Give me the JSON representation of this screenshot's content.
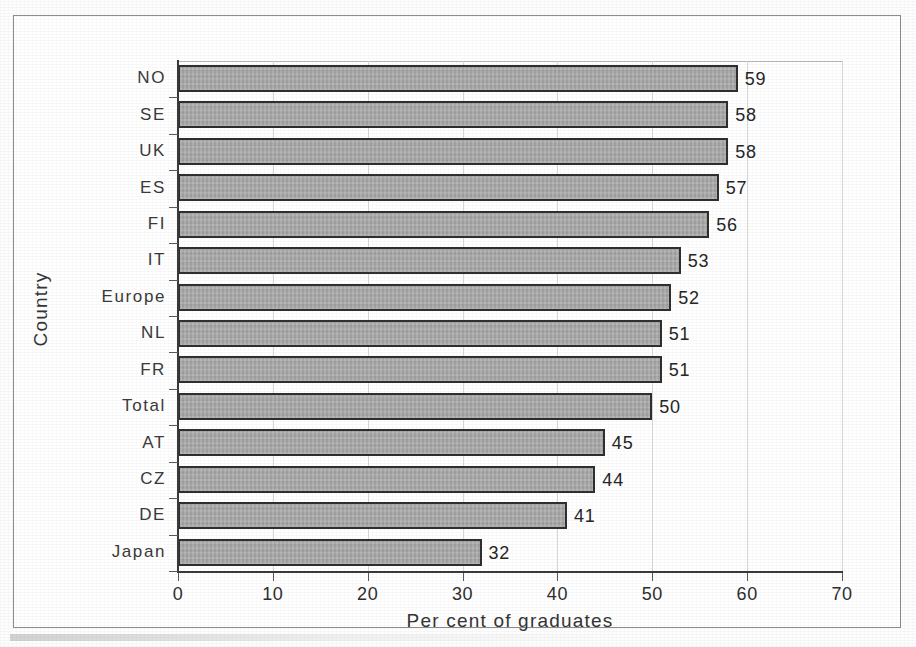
{
  "chart_data": {
    "type": "bar",
    "orientation": "horizontal",
    "title": "",
    "xlabel": "Per cent of graduates",
    "ylabel": "Country",
    "xlim": [
      0,
      70
    ],
    "xticks": [
      0,
      10,
      20,
      30,
      40,
      50,
      60,
      70
    ],
    "grid": true,
    "grid_axis": "x",
    "legend": false,
    "legend_position": "none",
    "categories": [
      "NO",
      "SE",
      "UK",
      "ES",
      "FI",
      "IT",
      "Europe",
      "NL",
      "FR",
      "Total",
      "AT",
      "CZ",
      "DE",
      "Japan"
    ],
    "values": [
      59,
      58,
      58,
      57,
      56,
      53,
      52,
      51,
      51,
      50,
      45,
      44,
      41,
      32
    ],
    "data_labels": [
      "59",
      "58",
      "58",
      "57",
      "56",
      "53",
      "52",
      "51",
      "51",
      "50",
      "45",
      "44",
      "41",
      "32"
    ],
    "series": [
      {
        "name": "Per cent of graduates",
        "values": [
          59,
          58,
          58,
          57,
          56,
          53,
          52,
          51,
          51,
          50,
          45,
          44,
          41,
          32
        ]
      }
    ]
  },
  "style": {
    "bar_fill": "#a9a9a9",
    "bar_border": "#2f2f2f",
    "axis_color": "#3a3a3a",
    "grid_color": "#d8d8d8",
    "frame_color": "#8c8c8c",
    "background": "#ffffff",
    "text_color": "#2e2e2e"
  }
}
